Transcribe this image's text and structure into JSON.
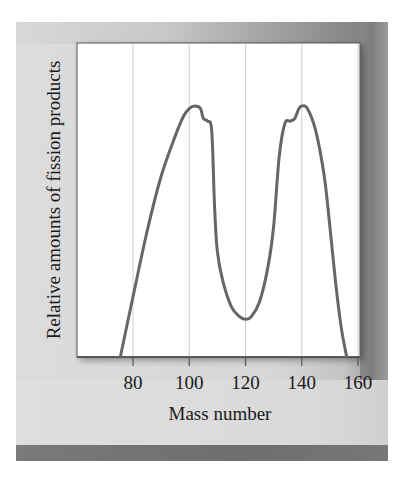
{
  "chart_data": {
    "type": "line",
    "title": "",
    "xlabel": "Mass number",
    "ylabel": "Relative amounts of fission products",
    "xlim": [
      70,
      161
    ],
    "ylim": [
      0,
      1.25
    ],
    "xticks": [
      80,
      100,
      120,
      140,
      160
    ],
    "xtick_labels": [
      "80",
      "100",
      "120",
      "140",
      "160"
    ],
    "grid": "vertical lines at x ticks",
    "legend": null,
    "series": [
      {
        "name": "Fission product yield",
        "color": "#666666",
        "x": [
          75.5,
          80,
          85,
          90,
          95,
          98,
          100,
          102,
          104,
          105,
          106.5,
          108,
          109,
          110,
          112,
          115,
          118,
          120,
          122,
          125,
          128,
          130,
          132,
          134,
          136,
          137.5,
          139,
          140,
          142,
          145,
          148,
          150,
          152,
          154,
          156
        ],
        "y": [
          0.0,
          0.24,
          0.5,
          0.72,
          0.88,
          0.96,
          0.99,
          1.0,
          0.99,
          0.95,
          0.94,
          0.9,
          0.6,
          0.42,
          0.3,
          0.2,
          0.16,
          0.15,
          0.16,
          0.22,
          0.36,
          0.52,
          0.8,
          0.93,
          0.94,
          0.95,
          0.99,
          1.0,
          0.99,
          0.9,
          0.72,
          0.52,
          0.3,
          0.12,
          0.0
        ]
      }
    ]
  },
  "figure": {
    "ylabel": "Relative amounts of fission products",
    "xlabel": "Mass number",
    "ticks": [
      "80",
      "100",
      "120",
      "140",
      "160"
    ]
  }
}
